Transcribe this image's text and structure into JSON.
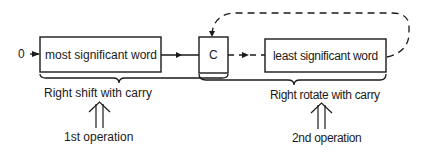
{
  "diagram": {
    "input_label": "0",
    "boxes": {
      "msw": "most significant word",
      "carry": "C",
      "lsw": "least significant word"
    },
    "braces": {
      "left": "Right shift with carry",
      "right": "Right rotate with carry"
    },
    "operations": {
      "first": "1st operation",
      "second": "2nd operation"
    },
    "colors": {
      "ink": "#1a1a1a",
      "background": "#ffffff"
    }
  }
}
